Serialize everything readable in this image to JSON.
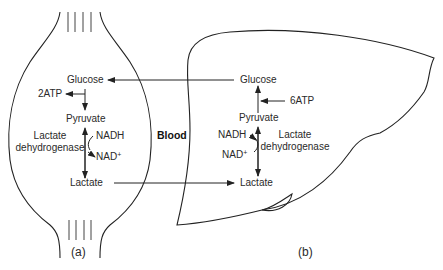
{
  "muscle": {
    "glucose": "Glucose",
    "atp": "2ATP",
    "pyruvate": "Pyruvate",
    "enzyme_line1": "Lactate",
    "enzyme_line2": "dehydrogenase",
    "nadh": "NADH",
    "nad": "NAD",
    "nad_sup": "+",
    "lactate": "Lactate",
    "caption": "(a)"
  },
  "blood": {
    "label": "Blood"
  },
  "liver": {
    "glucose": "Glucose",
    "atp": "6ATP",
    "pyruvate": "Pyruvate",
    "enzyme_line1": "Lactate",
    "enzyme_line2": "dehydrogenase",
    "nadh": "NADH",
    "nad": "NAD",
    "nad_sup": "+",
    "lactate": "Lactate",
    "caption": "(b)"
  },
  "colors": {
    "line": "#222222",
    "text": "#2a2a2a",
    "background": "#ffffff"
  }
}
